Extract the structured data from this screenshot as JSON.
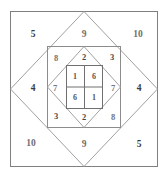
{
  "figure": {
    "type": "geometric-diagram",
    "canvas": {
      "width": 168,
      "height": 178
    },
    "colors": {
      "background": "#ffffff",
      "outer_square_stroke": "#808080",
      "outer_diamond_stroke": "#9a9a9a",
      "middle_square_stroke": "#8c8c8c",
      "middle_diamond_stroke": "#9a9a9a",
      "inner_square_stroke": "#707070",
      "inner_grid_stroke": "#707070",
      "text_dark": "#3b3b3b",
      "text_light": "#6e6e6e"
    },
    "rings": {
      "outer": {
        "name": "outer-square-ring",
        "labels": {
          "top_left": "5",
          "top_center": "9",
          "top_right": "10",
          "middle_left": "4",
          "middle_right": "4",
          "bottom_left": "10",
          "bottom_center": "9",
          "bottom_right": "5"
        }
      },
      "middle": {
        "name": "middle-square-ring",
        "labels": {
          "top_left": "8",
          "top_center": "2",
          "top_right": "3",
          "middle_left": "7",
          "middle_right": "7",
          "bottom_left": "3",
          "bottom_center": "2",
          "bottom_right": "8"
        }
      },
      "inner": {
        "name": "inner-2x2-grid",
        "cells": [
          {
            "position": "top-left",
            "value": "1"
          },
          {
            "position": "top-right",
            "value": "6"
          },
          {
            "position": "bottom-left",
            "value": "6"
          },
          {
            "position": "bottom-right",
            "value": "1"
          }
        ]
      }
    }
  }
}
